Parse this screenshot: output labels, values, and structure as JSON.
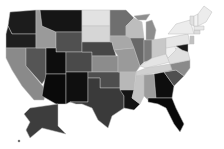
{
  "map": {
    "type": "choropleth",
    "region": "United States",
    "color_scale": "grayscale",
    "states": [
      {
        "id": "WA",
        "name": "Washington",
        "shade": "#1c1c1c",
        "d": "M10,12 L36,10 L36,34 L12,34 L8,26 Z"
      },
      {
        "id": "OR",
        "name": "Oregon",
        "shade": "#1f1f1f",
        "d": "M8,26 L12,34 L36,34 L36,48 L6,48 L6,34 Z"
      },
      {
        "id": "CA",
        "name": "California",
        "shade": "#8a8a8a",
        "d": "M6,48 L26,48 L26,66 L46,90 L44,100 L34,100 L22,86 L12,70 L6,58 Z"
      },
      {
        "id": "NV",
        "name": "Nevada",
        "shade": "#555555",
        "d": "M26,48 L46,48 L46,78 L42,84 L26,66 Z"
      },
      {
        "id": "ID",
        "name": "Idaho",
        "shade": "#9a9a9a",
        "d": "M36,10 L40,10 L42,26 L56,32 L56,48 L36,48 Z"
      },
      {
        "id": "MT",
        "name": "Montana",
        "shade": "#151515",
        "d": "M40,10 L82,10 L82,32 L56,32 L42,26 Z"
      },
      {
        "id": "WY",
        "name": "Wyoming",
        "shade": "#505050",
        "d": "M56,32 L82,32 L82,52 L56,52 Z"
      },
      {
        "id": "UT",
        "name": "Utah",
        "shade": "#0d0d0d",
        "d": "M46,48 L56,48 L56,52 L66,52 L66,74 L46,74 Z"
      },
      {
        "id": "CO",
        "name": "Colorado",
        "shade": "#4a4a4a",
        "d": "M66,52 L92,52 L92,72 L66,72 Z"
      },
      {
        "id": "AZ",
        "name": "Arizona",
        "shade": "#0a0a0a",
        "d": "M46,74 L66,74 L66,104 L56,104 L42,96 L44,84 Z"
      },
      {
        "id": "NM",
        "name": "New Mexico",
        "shade": "#0f0f0f",
        "d": "M66,72 L88,72 L88,102 L70,102 L66,104 Z"
      },
      {
        "id": "ND",
        "name": "North Dakota",
        "shade": "#e2e2e2",
        "d": "M82,10 L110,10 L110,26 L82,26 Z"
      },
      {
        "id": "SD",
        "name": "South Dakota",
        "shade": "#d6d6d6",
        "d": "M82,26 L110,26 L110,42 L82,42 Z"
      },
      {
        "id": "NE",
        "name": "Nebraska",
        "shade": "#474747",
        "d": "M82,42 L112,42 L116,56 L92,56 L92,52 L82,52 Z"
      },
      {
        "id": "KS",
        "name": "Kansas",
        "shade": "#8c8c8c",
        "d": "M92,56 L118,56 L118,72 L92,72 Z"
      },
      {
        "id": "OK",
        "name": "Oklahoma",
        "shade": "#4e4e4e",
        "d": "M88,72 L120,72 L120,88 L100,88 L100,78 L88,78 Z"
      },
      {
        "id": "TX",
        "name": "Texas",
        "shade": "#3a3a3a",
        "d": "M100,78 L100,88 L120,88 L124,96 L124,108 L112,116 L108,128 L98,120 L92,108 L82,104 L76,104 L70,102 L88,102 L88,78 Z"
      },
      {
        "id": "MN",
        "name": "Minnesota",
        "shade": "#6f6f6f",
        "d": "M110,10 L126,10 L134,18 L126,26 L126,36 L110,36 Z"
      },
      {
        "id": "IA",
        "name": "Iowa",
        "shade": "#a8a8a8",
        "d": "M110,36 L130,36 L134,48 L114,50 L112,42 L110,42 Z"
      },
      {
        "id": "MO",
        "name": "Missouri",
        "shade": "#9a9a9a",
        "d": "M114,50 L134,48 L140,66 L136,72 L118,72 L118,56 Z"
      },
      {
        "id": "AR",
        "name": "Arkansas",
        "shade": "#b8b8b8",
        "d": "M120,72 L136,72 L134,90 L120,90 L120,88 Z"
      },
      {
        "id": "LA",
        "name": "Louisiana",
        "shade": "#141414",
        "d": "M120,90 L134,90 L132,98 L140,104 L134,110 L124,108 L124,96 Z"
      },
      {
        "id": "WI",
        "name": "Wisconsin",
        "shade": "#bdbdbd",
        "d": "M126,26 L134,18 L142,22 L144,38 L130,38 L126,36 Z"
      },
      {
        "id": "IL",
        "name": "Illinois",
        "shade": "#686868",
        "d": "M130,38 L144,38 L144,62 L140,66 L134,48 Z"
      },
      {
        "id": "MI",
        "name": "Michigan",
        "shade": "#8e8e8e",
        "d": "M146,22 L152,20 L156,30 L154,40 L146,40 Z M134,16 L150,14 L146,20 L138,20 Z"
      },
      {
        "id": "IN",
        "name": "Indiana",
        "shade": "#7a7a7a",
        "d": "M144,40 L152,40 L152,60 L144,62 Z"
      },
      {
        "id": "OH",
        "name": "Ohio",
        "shade": "#c8c8c8",
        "d": "M152,40 L166,38 L166,54 L152,58 Z"
      },
      {
        "id": "KY",
        "name": "Kentucky",
        "shade": "#e4e4e4",
        "d": "M140,66 L152,58 L166,54 L170,62 L146,68 Z"
      },
      {
        "id": "TN",
        "name": "Tennessee",
        "shade": "#d0d0d0",
        "d": "M136,72 L146,68 L170,64 L172,70 L136,76 Z"
      },
      {
        "id": "MS",
        "name": "Mississippi",
        "shade": "#c4c4c4",
        "d": "M136,76 L144,75 L144,96 L140,104 L132,98 L134,90 Z"
      },
      {
        "id": "AL",
        "name": "Alabama",
        "shade": "#9c9c9c",
        "d": "M144,75 L154,74 L156,98 L148,98 L148,100 L144,96 Z"
      },
      {
        "id": "GA",
        "name": "Georgia",
        "shade": "#0e0e0e",
        "d": "M154,74 L164,72 L174,86 L172,98 L156,98 Z"
      },
      {
        "id": "FL",
        "name": "Florida",
        "shade": "#080808",
        "d": "M148,98 L172,98 L176,108 L184,124 L180,132 L174,124 L166,108 L158,104 L148,102 Z"
      },
      {
        "id": "SC",
        "name": "South Carolina",
        "shade": "#505050",
        "d": "M164,72 L176,70 L184,76 L174,86 Z"
      },
      {
        "id": "NC",
        "name": "North Carolina",
        "shade": "#8a8a8a",
        "d": "M170,64 L190,60 L190,68 L184,76 L176,70 L164,72 L172,70 Z"
      },
      {
        "id": "VA",
        "name": "Virginia",
        "shade": "#e0e0e0",
        "d": "M166,54 L180,46 L188,52 L190,60 L170,64 Z"
      },
      {
        "id": "WV",
        "name": "West Virginia",
        "shade": "#f0f0f0",
        "d": "M166,46 L174,44 L176,50 L168,58 L166,54 Z"
      },
      {
        "id": "PA",
        "name": "Pennsylvania",
        "shade": "#e6e6e6",
        "d": "M166,38 L188,34 L190,44 L166,48 Z"
      },
      {
        "id": "MD",
        "name": "Maryland",
        "shade": "#1a1a1a",
        "d": "M176,46 L188,44 L188,52 L182,50 Z"
      },
      {
        "id": "NY",
        "name": "New York",
        "shade": "#ececec",
        "d": "M168,34 L176,24 L190,20 L194,34 L188,34 Z"
      },
      {
        "id": "NJ",
        "name": "New Jersey",
        "shade": "#c0c0c0",
        "d": "M190,36 L194,36 L194,44 L190,44 Z"
      },
      {
        "id": "CT",
        "name": "Connecticut",
        "shade": "#dcdcdc",
        "d": "M194,30 L200,30 L200,34 L194,34 Z"
      },
      {
        "id": "MA",
        "name": "Massachusetts",
        "shade": "#e8e8e8",
        "d": "M194,26 L204,26 L204,30 L194,30 Z"
      },
      {
        "id": "VT",
        "name": "Vermont",
        "shade": "#e0e0e0",
        "d": "M190,16 L194,16 L194,26 L190,24 Z"
      },
      {
        "id": "NH",
        "name": "New Hampshire",
        "shade": "#f2f2f2",
        "d": "M194,16 L198,14 L198,26 L194,26 Z"
      },
      {
        "id": "ME",
        "name": "Maine",
        "shade": "#ececec",
        "d": "M198,14 L204,6 L212,12 L206,22 L198,26 Z"
      },
      {
        "id": "AK",
        "name": "Alaska",
        "shade": "#3d3d3d",
        "d": "M30,108 L58,104 L58,126 L66,134 L58,132 L42,128 L30,138 L26,130 L30,122 L24,114 Z"
      },
      {
        "id": "HI",
        "name": "Hawaii",
        "shade": "#3d3d3d",
        "d": "M18,140 L20,140 L20,142 L18,142 Z"
      }
    ]
  }
}
